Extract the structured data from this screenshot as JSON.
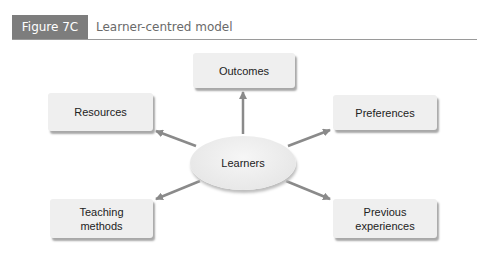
{
  "figure": {
    "label": "Figure 7C",
    "title": "Learner-centred model",
    "colors": {
      "label_bg": "#7d7d7d",
      "box_bg": "#efefef",
      "arrow": "#8a8a8a"
    }
  },
  "diagram": {
    "center": "Learners",
    "nodes": [
      {
        "id": "outcomes",
        "label": "Outcomes"
      },
      {
        "id": "resources",
        "label": "Resources"
      },
      {
        "id": "preferences",
        "label": "Preferences"
      },
      {
        "id": "teaching-methods",
        "label": "Teaching methods"
      },
      {
        "id": "previous-experiences",
        "label": "Previous experiences"
      }
    ],
    "edges": [
      {
        "from": "Learners",
        "to": "Outcomes"
      },
      {
        "from": "Learners",
        "to": "Resources"
      },
      {
        "from": "Learners",
        "to": "Preferences"
      },
      {
        "from": "Learners",
        "to": "Teaching methods"
      },
      {
        "from": "Learners",
        "to": "Previous experiences"
      }
    ]
  }
}
